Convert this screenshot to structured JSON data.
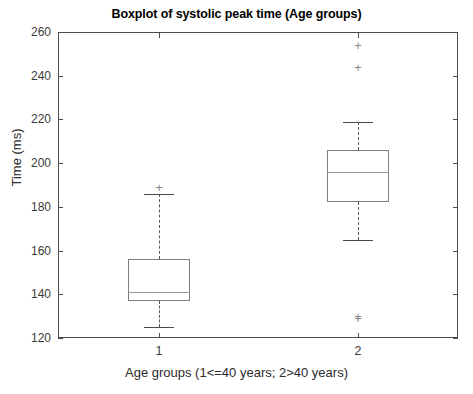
{
  "chart_data": {
    "type": "boxplot",
    "title": "Boxplot of systolic peak time (Age groups)",
    "xlabel": "Age groups (1<=40 years; 2>40 years)",
    "ylabel": "Time (ms)",
    "ylim": [
      120,
      260
    ],
    "yticks": [
      120,
      140,
      160,
      180,
      200,
      220,
      240,
      260
    ],
    "xticks": [
      1,
      2
    ],
    "xtick_labels": [
      "1",
      "2"
    ],
    "grid": false,
    "legend": "none",
    "box_color": "#7d7d7d",
    "median_color": "#9a9a9a",
    "whisker_color": "#5a5a5a",
    "outlier_color": "#8a8a8a",
    "outlier_marker": "+",
    "categories": [
      "1",
      "2"
    ],
    "boxes": [
      {
        "label": "1",
        "x": 1,
        "whisker_low": 125,
        "q1": 137,
        "median": 141,
        "q3": 156,
        "whisker_high": 186,
        "outliers": [
          189
        ]
      },
      {
        "label": "2",
        "x": 2,
        "whisker_low": 165,
        "q1": 182,
        "median": 196,
        "q3": 206,
        "whisker_high": 219,
        "outliers": [
          254,
          244,
          130,
          129
        ]
      }
    ]
  },
  "axis": {
    "ytick_labels": [
      "260",
      "240",
      "220",
      "200",
      "180",
      "160",
      "140",
      "120"
    ]
  }
}
